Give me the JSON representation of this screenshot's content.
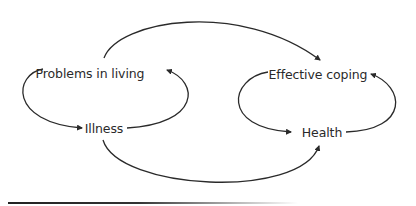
{
  "diagram": {
    "nodes": [
      {
        "id": "problems",
        "label": "Problems in living",
        "x": 90,
        "y": 73
      },
      {
        "id": "coping",
        "label": "Effective coping",
        "x": 318,
        "y": 74
      },
      {
        "id": "illness",
        "label": "Illness",
        "x": 104,
        "y": 128
      },
      {
        "id": "health",
        "label": "Health",
        "x": 322,
        "y": 132
      }
    ],
    "edges": [
      {
        "from": "problems",
        "to": "coping",
        "style": "arc-over"
      },
      {
        "from": "illness",
        "to": "health",
        "style": "arc-under"
      },
      {
        "from": "problems",
        "to": "illness",
        "style": "loop-left"
      },
      {
        "from": "illness",
        "to": "problems",
        "style": "loop-right"
      },
      {
        "from": "coping",
        "to": "health",
        "style": "loop-left"
      },
      {
        "from": "health",
        "to": "coping",
        "style": "loop-right"
      }
    ],
    "line_color": "#2a2a2a"
  }
}
